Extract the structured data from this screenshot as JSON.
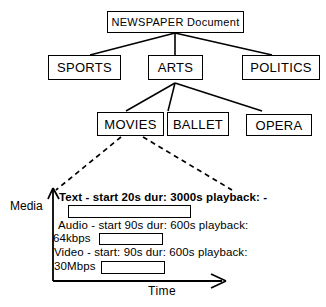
{
  "diagram": {
    "title_node": "NEWSPAPER Document",
    "tree": {
      "root": {
        "label": "NEWSPAPER Document"
      },
      "level2": [
        {
          "label": "SPORTS"
        },
        {
          "label": "ARTS"
        },
        {
          "label": "POLITICS"
        }
      ],
      "level3": [
        {
          "label": "MOVIES"
        },
        {
          "label": "BALLET"
        },
        {
          "label": "OPERA"
        }
      ]
    },
    "timeline": {
      "y_axis_label": "Media",
      "x_axis_label": "Time",
      "tracks": [
        {
          "name": "Text",
          "description": "Text - start 20s dur: 3000s playback: -",
          "rate": "",
          "start": "20s",
          "duration": "3000s",
          "playback": "-"
        },
        {
          "name": "Audio",
          "description": "Audio - start 90s dur: 600s playback:",
          "rate": "64kbps",
          "start": "90s",
          "duration": "600s",
          "playback": ""
        },
        {
          "name": "Video",
          "description": "Video - start: 90s dur: 600s playback:",
          "rate": "30Mbps",
          "start": "90s",
          "duration": "600s",
          "playback": ""
        }
      ]
    },
    "colors": {
      "stroke": "#000000",
      "background": "#ffffff"
    }
  }
}
